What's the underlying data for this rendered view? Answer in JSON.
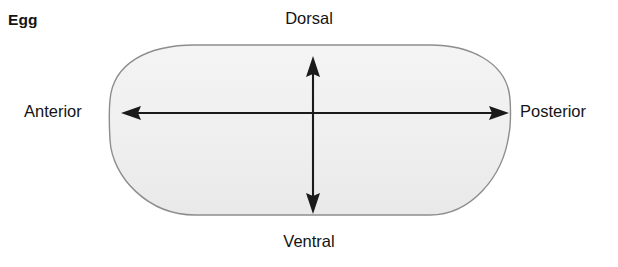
{
  "figure": {
    "panel_label": "Egg",
    "shape_name": "egg-outline",
    "fill_color": "#f0f0f0",
    "stroke_color": "#8a8a8a",
    "arrow_color": "#1a1a1a",
    "background_color": "#ffffff"
  },
  "axes": [
    {
      "id": "anterior-posterior",
      "orientation": "horizontal",
      "start_label": "Anterior",
      "end_label": "Posterior",
      "double_headed": true
    },
    {
      "id": "dorsal-ventral",
      "orientation": "vertical",
      "start_label": "Dorsal",
      "end_label": "Ventral",
      "double_headed": true
    }
  ],
  "labels": {
    "dorsal": "Dorsal",
    "ventral": "Ventral",
    "anterior": "Anterior",
    "posterior": "Posterior"
  }
}
